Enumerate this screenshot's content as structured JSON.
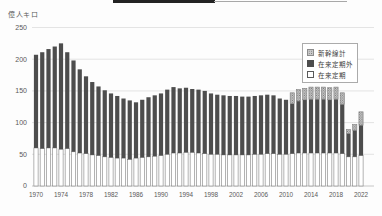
{
  "top_edge": {
    "note": "partially cropped black element at top of scan"
  },
  "chart_data": {
    "type": "bar",
    "subtype": "stacked",
    "title": "",
    "ylabel": "億人キロ",
    "xlabel": "",
    "ylim": [
      0,
      250
    ],
    "yticks": [
      0,
      50,
      100,
      150,
      200,
      250
    ],
    "grid": "horizontal",
    "legend_position": "upper-right-inside",
    "legend": [
      "新幹線計",
      "在来定期外",
      "在来定期"
    ],
    "years": [
      1970,
      1971,
      1972,
      1973,
      1974,
      1975,
      1976,
      1977,
      1978,
      1979,
      1980,
      1981,
      1982,
      1983,
      1984,
      1985,
      1986,
      1987,
      1988,
      1989,
      1990,
      1991,
      1992,
      1993,
      1994,
      1995,
      1996,
      1997,
      1998,
      1999,
      2000,
      2001,
      2002,
      2003,
      2004,
      2005,
      2006,
      2007,
      2008,
      2009,
      2010,
      2011,
      2012,
      2013,
      2014,
      2015,
      2016,
      2017,
      2018,
      2019,
      2020,
      2021,
      2022
    ],
    "xtick_years": [
      1970,
      1974,
      1978,
      1982,
      1986,
      1990,
      1994,
      1998,
      2002,
      2006,
      2010,
      2014,
      2018,
      2022
    ],
    "series": [
      {
        "name": "在来定期",
        "style": "open",
        "values": [
          60,
          59,
          60,
          60,
          58,
          59,
          54,
          52,
          51,
          49,
          48,
          46,
          45,
          44,
          44,
          42,
          44,
          45,
          46,
          47,
          48,
          50,
          52,
          52,
          53,
          53,
          52,
          51,
          50,
          50,
          49,
          49,
          49,
          49,
          49,
          50,
          50,
          51,
          51,
          50,
          50,
          51,
          52,
          52,
          52,
          52,
          52,
          52,
          52,
          51,
          46,
          46,
          48
        ]
      },
      {
        "name": "在来定期外",
        "style": "solid",
        "values": [
          147,
          152,
          156,
          160,
          167,
          152,
          144,
          132,
          122,
          115,
          109,
          105,
          101,
          98,
          94,
          93,
          88,
          91,
          94,
          96,
          98,
          102,
          104,
          102,
          102,
          100,
          100,
          99,
          96,
          94,
          94,
          93,
          93,
          92,
          92,
          92,
          93,
          93,
          92,
          88,
          86,
          79,
          82,
          84,
          85,
          85,
          85,
          84,
          85,
          78,
          37,
          42,
          48
        ]
      },
      {
        "name": "新幹線計",
        "style": "dotted",
        "values": [
          0,
          0,
          0,
          0,
          0,
          0,
          0,
          0,
          0,
          0,
          0,
          0,
          0,
          0,
          0,
          0,
          0,
          0,
          0,
          0,
          0,
          0,
          0,
          0,
          0,
          0,
          0,
          0,
          0,
          0,
          0,
          0,
          0,
          0,
          0,
          0,
          0,
          0,
          0,
          0,
          0,
          17,
          18,
          18,
          19,
          19,
          19,
          19,
          19,
          18,
          6,
          9,
          21
        ]
      }
    ],
    "colors": {
      "solid_bar": "#4d4d4d",
      "open_bar_fill": "#ffffff",
      "open_bar_stroke": "#808080",
      "dotted_bar_bg": "#c9c9c9",
      "dotted_bar_dot": "#6e6e6e",
      "gridline": "#d9d9d9",
      "axis_line": "#bfbfbf",
      "tick_text": "#595959"
    }
  }
}
